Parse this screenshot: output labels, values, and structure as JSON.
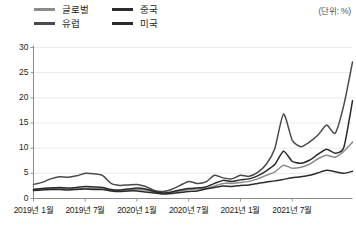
{
  "unit_note": "(단위: %)",
  "legend": {
    "items": [
      {
        "label": "글로벌",
        "color": "#8c8c8c",
        "row": 0,
        "col": 0
      },
      {
        "label": "중국",
        "color": "#2b2b2b",
        "row": 0,
        "col": 1
      },
      {
        "label": "유럽",
        "color": "#4a4a4a",
        "row": 1,
        "col": 0
      },
      {
        "label": "미국",
        "color": "#2b2b2b",
        "row": 1,
        "col": 1
      }
    ]
  },
  "axes": {
    "y_ticks": [
      "0",
      "5",
      "10",
      "15",
      "20",
      "25",
      "30"
    ],
    "x_ticks": [
      "2019년 1월",
      "2019년 7월",
      "2020년 1월",
      "2020년 7월",
      "2021년 1월",
      "2021년 7월"
    ]
  },
  "chart_data": {
    "type": "line",
    "title": "",
    "xlabel": "",
    "ylabel": "",
    "unit": "%",
    "ylim": [
      0,
      30
    ],
    "ygrid": true,
    "legend_position": "top-left",
    "x": [
      "2019-01",
      "2019-02",
      "2019-03",
      "2019-04",
      "2019-05",
      "2019-06",
      "2019-07",
      "2019-08",
      "2019-09",
      "2019-10",
      "2019-11",
      "2019-12",
      "2020-01",
      "2020-02",
      "2020-03",
      "2020-04",
      "2020-05",
      "2020-06",
      "2020-07",
      "2020-08",
      "2020-09",
      "2020-10",
      "2020-11",
      "2020-12",
      "2021-01",
      "2021-02",
      "2021-03",
      "2021-04",
      "2021-05",
      "2021-06",
      "2021-07",
      "2021-08",
      "2021-09",
      "2021-10",
      "2021-11",
      "2021-12",
      "2022-01",
      "2022-02"
    ],
    "x_tick_indices": [
      0,
      6,
      12,
      18,
      24,
      30
    ],
    "series": [
      {
        "name": "유럽",
        "color": "#4a4a4a",
        "values": [
          2.8,
          3.2,
          3.9,
          4.3,
          4.2,
          4.5,
          5.0,
          4.9,
          4.6,
          3.0,
          2.6,
          2.7,
          2.8,
          2.4,
          1.6,
          1.4,
          1.8,
          2.6,
          3.4,
          3.0,
          3.3,
          4.6,
          4.1,
          3.9,
          4.6,
          4.4,
          5.2,
          6.8,
          10.0,
          16.8,
          11.6,
          10.3,
          11.2,
          12.6,
          14.6,
          13.0,
          18.6,
          27.1
        ]
      },
      {
        "name": "미국",
        "color": "#2b2b2b",
        "values": [
          1.8,
          2.0,
          2.1,
          2.2,
          2.1,
          2.2,
          2.4,
          2.3,
          2.2,
          1.8,
          1.7,
          1.9,
          2.1,
          1.9,
          1.4,
          1.1,
          1.3,
          1.7,
          2.0,
          2.1,
          2.3,
          3.0,
          3.6,
          3.4,
          3.7,
          3.9,
          4.5,
          5.5,
          6.8,
          9.4,
          7.4,
          7.0,
          7.6,
          8.8,
          9.8,
          9.0,
          10.2,
          19.4
        ]
      },
      {
        "name": "글로벌",
        "color": "#8c8c8c",
        "values": [
          1.8,
          1.9,
          2.0,
          2.0,
          1.9,
          1.9,
          2.0,
          2.0,
          1.9,
          1.7,
          1.6,
          1.7,
          1.8,
          1.7,
          1.3,
          1.1,
          1.2,
          1.5,
          1.8,
          1.9,
          2.0,
          2.5,
          3.0,
          3.0,
          3.2,
          3.4,
          3.9,
          4.6,
          5.3,
          6.6,
          6.0,
          6.2,
          6.8,
          7.9,
          8.6,
          8.2,
          9.4,
          11.2
        ]
      },
      {
        "name": "중국",
        "color": "#2b2b2b",
        "values": [
          1.6,
          1.7,
          1.8,
          1.8,
          1.7,
          1.8,
          1.9,
          1.8,
          1.8,
          1.5,
          1.4,
          1.5,
          1.5,
          1.3,
          1.1,
          0.9,
          1.0,
          1.2,
          1.4,
          1.5,
          1.9,
          2.2,
          2.5,
          2.4,
          2.6,
          2.7,
          3.0,
          3.3,
          3.5,
          3.8,
          4.1,
          4.3,
          4.6,
          5.1,
          5.6,
          5.3,
          5.0,
          5.4
        ]
      }
    ]
  }
}
